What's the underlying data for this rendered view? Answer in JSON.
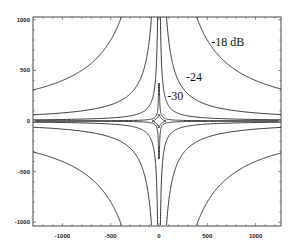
{
  "chart_data": {
    "type": "line",
    "subtype": "contour",
    "title": "",
    "xlabel": "",
    "ylabel": "",
    "xlim": [
      -1300,
      1260
    ],
    "ylim": [
      -1040,
      1030
    ],
    "x_ticks": [
      -1000,
      -500,
      0,
      500,
      1000
    ],
    "y_ticks": [
      -1000,
      -500,
      0,
      500,
      1000
    ],
    "x_tick_labels": [
      "-1000",
      "-500",
      "0",
      "500",
      "1000"
    ],
    "y_tick_labels": [
      "-1000",
      "-500",
      "0",
      "500",
      "1000"
    ],
    "grid": false,
    "legend": null,
    "series": [
      {
        "name": "-18 dB",
        "label": "-18 dB",
        "shape": "hyperbola |x*y| = const",
        "xy_const": 400000
      },
      {
        "name": "-24",
        "label": "-24",
        "shape": "hyperbola |x*y| = const",
        "xy_const": 80000
      },
      {
        "name": "-30",
        "label": "-30",
        "shape": "hyperbola |x*y| = const",
        "xy_const": 15000
      }
    ],
    "annotations": [
      {
        "text": "-18 dB",
        "x": 540,
        "y": 740
      },
      {
        "text": "-24",
        "x": 280,
        "y": 400
      },
      {
        "text": "-30",
        "x": 85,
        "y": 210
      }
    ]
  }
}
